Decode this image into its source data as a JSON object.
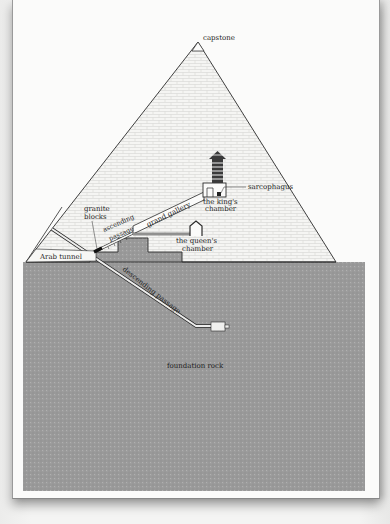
{
  "diagram": {
    "colors": {
      "paper": "#fbfbfa",
      "brick": "#f4f4f2",
      "brick_line": "#c9c9c6",
      "foundation": "#9b9b9b",
      "outline": "#2a2a2a"
    },
    "labels": {
      "capstone": "capstone",
      "sarcophagus": "sarcophagus",
      "kings_chamber_1": "the king's",
      "kings_chamber_2": "chamber",
      "grand_gallery": "grand gallery",
      "granite_blocks_1": "granite",
      "granite_blocks_2": "blocks",
      "ascending_passage_1": "ascending",
      "ascending_passage_2": "passage",
      "queens_chamber_1": "the queen's",
      "queens_chamber_2": "chamber",
      "arab_tunnel": "Arab tunnel",
      "descending_passage": "descending passage",
      "foundation_rock": "foundation rock"
    }
  }
}
